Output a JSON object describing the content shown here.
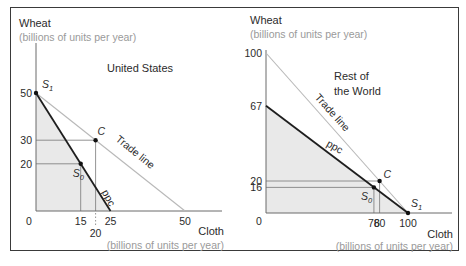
{
  "chart_data": [
    {
      "type": "line",
      "title": "United States",
      "ylabel": "Wheat",
      "ylabel_sub": "(billions of units per year)",
      "xlabel": "Cloth",
      "xlabel_sub": "(billions of units per year)",
      "xlim": [
        0,
        50
      ],
      "ylim": [
        0,
        50
      ],
      "origin_label": "0",
      "x_ticks": [
        15,
        20,
        25,
        50
      ],
      "y_ticks": [
        50,
        30,
        20
      ],
      "series": [
        {
          "name": "ppc",
          "points": [
            [
              0,
              50
            ],
            [
              25,
              0
            ]
          ],
          "shaded": true
        },
        {
          "name": "Trade line",
          "points": [
            [
              0,
              50
            ],
            [
              50,
              0
            ]
          ]
        }
      ],
      "points": [
        {
          "name": "S1",
          "x": 0,
          "y": 50
        },
        {
          "name": "S0",
          "x": 15,
          "y": 20
        },
        {
          "name": "C",
          "x": 20,
          "y": 30
        }
      ]
    },
    {
      "type": "line",
      "title": "Rest of the World",
      "title_lines": [
        "Rest of",
        "the World"
      ],
      "ylabel": "Wheat",
      "ylabel_sub": "(billions of units per year)",
      "xlabel": "Cloth",
      "xlabel_sub": "(billions of units per year)",
      "xlim": [
        0,
        100
      ],
      "ylim": [
        0,
        100
      ],
      "origin_label": "0",
      "x_ticks": [
        76,
        80,
        100
      ],
      "y_ticks": [
        100,
        67,
        20,
        16
      ],
      "series": [
        {
          "name": "ppc",
          "points": [
            [
              0,
              67
            ],
            [
              100,
              0
            ]
          ],
          "shaded": true
        },
        {
          "name": "Trade line",
          "points": [
            [
              0,
              100
            ],
            [
              100,
              0
            ]
          ]
        }
      ],
      "points": [
        {
          "name": "S1",
          "x": 100,
          "y": 0
        },
        {
          "name": "S0",
          "x": 76,
          "y": 16
        },
        {
          "name": "C",
          "x": 80,
          "y": 20
        }
      ]
    }
  ],
  "labels": {
    "ppc": "ppc",
    "trade_line": "Trade line",
    "S": "S",
    "sub1": "1",
    "sub0": "0",
    "C": "C"
  },
  "colors": {
    "ppc": "#1e1e1e",
    "trade_line": "#b8b8b8",
    "shade": "#e9e9e9",
    "axis": "#6a6a6a",
    "guide": "#777777"
  }
}
